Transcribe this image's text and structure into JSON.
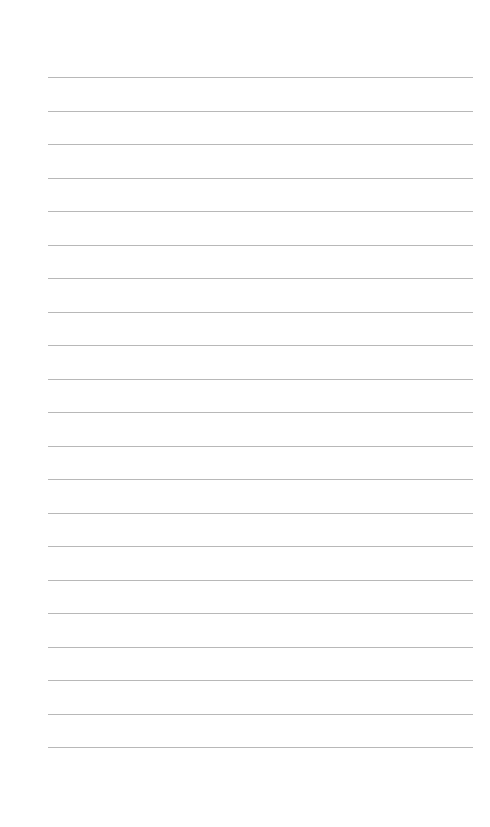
{
  "page": {
    "type": "lined-paper",
    "line_count": 21,
    "first_line_y": 77,
    "line_spacing": 33.5,
    "line_left": 48,
    "line_width": 425,
    "line_color": "#b8b8b8",
    "background": "#ffffff"
  }
}
